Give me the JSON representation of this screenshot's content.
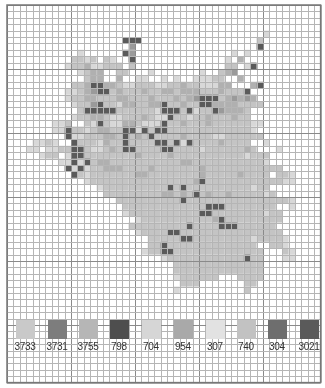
{
  "grid": {
    "origin_x": 7,
    "origin_y": 5,
    "cell": 6.4,
    "cols": 49,
    "rows": 59,
    "minor_color": "#b5b5b5",
    "major_color": "#8a8a8a",
    "major_every": 10
  },
  "palette": {
    "a": "#d8d8d8",
    "b": "#c4c4c4",
    "c": "#b0b0b0",
    "d": "#9a9a9a",
    "e": "#5a5a5a",
    "f": "#e6e6e6"
  },
  "pattern_rows": [
    "................................................",
    "................................................",
    "................................................",
    "................................................",
    "........................................a.......",
    "..................eee..................b........",
    "...................d...................e........",
    "...........a......ed...............a.a.........",
    "..........bbab.ba..e..............a.c..........",
    ".........abbcaabbb.b..............bb.ae.........",
    "...........abcc..bb...a.......a..bcd...........",
    "............bcc..c..aa..a.a..aaabb..c..........",
    "..........bbceeccbaabbbaabbcbbaaacc...ce.......",
    ".........aabcdeebcbbbcbbccbcccbbbcbbbe.........",
    ".........abbccbbbccbbbcbbbcbcdeeebcdcdc........",
    "..........abbdebbaccbbccebbcbbeeccccbbbb.......",
    "...........beeeeebbbbbbaeeebeabbedcccb.........",
    "..........abbccbaabbbcbaaebbabbcbbbcbb.........",
    ".......aab..baebaaccbaaaebbcbbbcbbbbbbaa.......",
    ".......aaebbabccbbeeaebeebbbbbbbbbbbbba........",
    ".........eaabbbccbebcbebbbbcbbbbaabbbbbb.......",
    "....aaba..ebbbacbbebbbbeebeaebbbbcbbbb..a......",
    "...aa.aabbeebaabcbeebbbbeebbbbabbbbbbcb...a....",
    ".....abb.aeebbbbbbbbcbbbbcbbbbbbbbbbbabbb.......",
    "........aaeaebccbbbbbbbbbbbccbbbbbbbbbbba.......",
    ".........eaeabbcccbbbbcbbbbbbbcbbbbbbbbbbbb.....",
    "..........ebabbbbbbbccbbbbbbbbcbbbbbcbbbb.bba...",
    "............abbbbbbbbbbbbbbbbcebbbbbbbbbbbbaa...",
    "..............abbbbbbbbbbebebbbbbbbbbbabb.......",
    "...............bbbbbbbbbccbcbebcbbcbbbbbab......",
    ".................bbbbbbbbbbebbbbbbbbbbbbbbbba...",
    "..................bbbbbbbbbbbbbeeebbbbbbbb..a...",
    "..................abbbbbbbbbbbeebbbbbbbbabb.....",
    "....................abbbbbbbbbbbcebbbbbbbbb.....",
    "...................bbbbbbbbbebbbbeeebbbbbb......",
    "....................abbbbeebbbbbbbbbbbbbbbb.....",
    "......................bbbbbeebbbbbbbbbabbbba....",
    "......................bbebbbbbbbbbbbbbb..bba....",
    ".....................abbeebbbbbbbbbbbbbb...ba...",
    "........................abbbbbbbbbbbbebb...aa...",
    "..........................bbbbbbbbbbbbbb........",
    "..........................bbbbbbbbbbbbbb........",
    "..........................abbbbbb...bbbb........",
    "...........................bbb.......bb.........",
    "..........................a..........b..........",
    "................................................",
    "................................................",
    "................................................",
    "................................................"
  ],
  "legend": [
    {
      "code": "3733",
      "color": "#c9c9c9"
    },
    {
      "code": "3731",
      "color": "#7d7d7d"
    },
    {
      "code": "3755",
      "color": "#b6b6b6"
    },
    {
      "code": "798",
      "color": "#4e4e4e"
    },
    {
      "code": "704",
      "color": "#d6d6d6"
    },
    {
      "code": "954",
      "color": "#a9a9a9"
    },
    {
      "code": "307",
      "color": "#e2e2e2"
    },
    {
      "code": "740",
      "color": "#c2c2c2"
    },
    {
      "code": "304",
      "color": "#6e6e6e"
    },
    {
      "code": "3021",
      "color": "#5a5a5a"
    }
  ]
}
